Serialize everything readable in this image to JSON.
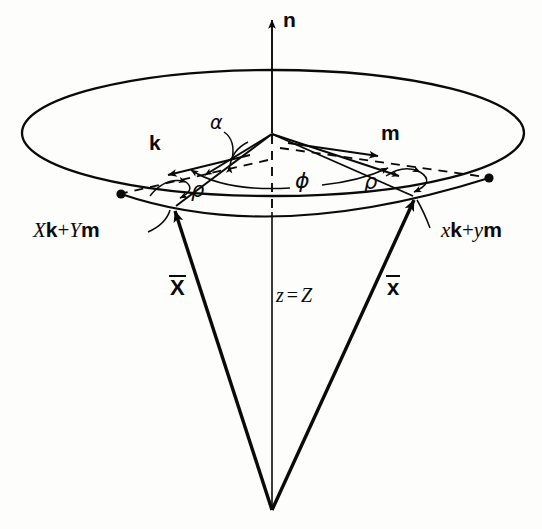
{
  "figure": {
    "ink_color": "#0a0a0a",
    "background": "#fdfdfb"
  },
  "labels": {
    "normal_axis": "n",
    "vector_k": "k",
    "vector_m": "m",
    "angle_alpha": "α",
    "angle_phi": "ϕ",
    "angle_rho_left": "ρ",
    "angle_rho_right": "ρ",
    "point_left_prefix_X": "X",
    "point_left_k": "k",
    "point_left_plus": "+",
    "point_left_prefix_Y": "Y",
    "point_left_m": "m",
    "point_right_prefix_x": "x",
    "point_right_k": "k",
    "point_right_plus": "+",
    "point_right_prefix_y": "y",
    "point_right_m": "m",
    "vector_X_bar": "X",
    "vector_x_bar": "x",
    "axis_depth_z": "z",
    "axis_depth_eq": "=",
    "axis_depth_Z": "Z"
  },
  "geometry": {
    "ellipse_center_x": 273,
    "ellipse_center_y": 133,
    "ellipse_rx": 251,
    "ellipse_ry": 63,
    "hub_x": 272,
    "hub_y": 133,
    "apex_x": 272,
    "apex_y": 510,
    "left_rim_point_x": 121,
    "left_rim_point_y": 194,
    "right_rim_point_x": 489,
    "right_rim_point_y": 178,
    "left_base_x": 172,
    "left_base_y": 207,
    "right_base_x": 415,
    "right_base_y": 197,
    "axis_top_y": 14
  }
}
